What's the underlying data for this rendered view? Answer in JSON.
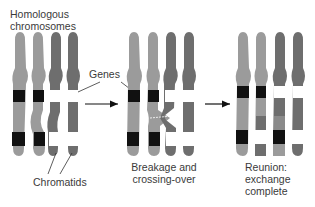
{
  "labels": {
    "homologous": [
      "Homologous",
      "chromosomes"
    ],
    "genes": "Genes",
    "chromatids": "Chromatids",
    "breakage": [
      "Breakage and",
      "crossing-over"
    ],
    "reunion": [
      "Reunion:",
      "exchange",
      "complete"
    ]
  },
  "colors": {
    "light_chromosome": "#9b9b9b",
    "dark_chromosome": "#6e6e6e",
    "gene_black": "#111111",
    "gene_white": "#ffffff",
    "exchanged_light": "#8a8a8a"
  },
  "stages": [
    "Homologous chromosomes",
    "Breakage and crossing-over",
    "Reunion: exchange complete"
  ]
}
